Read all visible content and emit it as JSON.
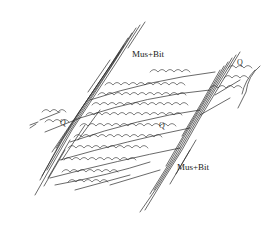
{
  "figure": {
    "type": "geological microstructure sketch",
    "background": "#ffffff",
    "stroke_color": "#2a2a2a",
    "labels": [
      {
        "id": "mica_upper",
        "text": "Mus+Bit",
        "x": 132,
        "y": 50
      },
      {
        "id": "mica_lower",
        "text": "Mus+Bit",
        "x": 177,
        "y": 163
      }
    ],
    "grain_labels": [
      {
        "id": "quartz_top_right",
        "text": "Q",
        "x": 237,
        "y": 59
      },
      {
        "id": "quartz_left",
        "text": "Q",
        "x": 60,
        "y": 119
      },
      {
        "id": "quartz_center",
        "text": "Q",
        "x": 159,
        "y": 122
      }
    ]
  }
}
